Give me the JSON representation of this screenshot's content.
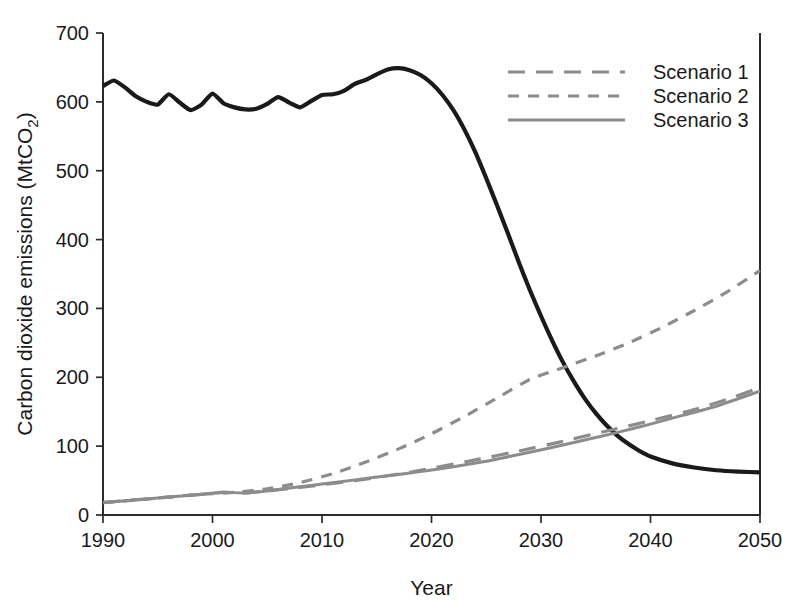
{
  "chart_data": {
    "type": "line",
    "title": "",
    "xlabel": "Year",
    "ylabel": "Carbon dioxide emissions (MtCO2)",
    "ylabel_base": "Carbon dioxide emissions (MtCO",
    "ylabel_sub": "2",
    "ylabel_close": ")",
    "xlim": [
      1990,
      2050
    ],
    "ylim": [
      0,
      700
    ],
    "xticks": [
      1990,
      2000,
      2010,
      2020,
      2030,
      2040,
      2050
    ],
    "xtick_labels": [
      "1990",
      "2000",
      "2010",
      "2020",
      "2030",
      "2040",
      "2050"
    ],
    "yticks": [
      0,
      100,
      200,
      300,
      400,
      500,
      600,
      700
    ],
    "ytick_labels": [
      "0",
      "100",
      "200",
      "300",
      "400",
      "500",
      "600",
      "700"
    ],
    "grid": false,
    "legend_position": "top-right",
    "legend": [
      "Scenario 1",
      "Scenario 2",
      "Scenario 3"
    ],
    "series": [
      {
        "name": "Historical and projected total emissions",
        "color": "#1a1a1a",
        "style": "solid",
        "width": 4.2,
        "in_legend": false,
        "x": [
          1990,
          1991,
          1992,
          1993,
          1994,
          1995,
          1996,
          1997,
          1998,
          1999,
          2000,
          2001,
          2002,
          2003,
          2004,
          2005,
          2006,
          2007,
          2008,
          2009,
          2010,
          2011,
          2012,
          2013,
          2014,
          2015,
          2016,
          2017,
          2018,
          2019,
          2020,
          2021,
          2022,
          2023,
          2024,
          2025,
          2026,
          2027,
          2028,
          2029,
          2030,
          2031,
          2032,
          2033,
          2034,
          2035,
          2036,
          2037,
          2038,
          2039,
          2040,
          2042,
          2044,
          2046,
          2048,
          2050
        ],
        "y": [
          623,
          631,
          621,
          608,
          600,
          596,
          611,
          599,
          588,
          596,
          612,
          598,
          592,
          589,
          590,
          597,
          607,
          599,
          592,
          601,
          610,
          611,
          616,
          626,
          632,
          640,
          647,
          649,
          646,
          639,
          627,
          610,
          588,
          560,
          527,
          489,
          449,
          408,
          366,
          326,
          289,
          254,
          222,
          194,
          169,
          148,
          130,
          115,
          103,
          93,
          85,
          75,
          69,
          65,
          63,
          62
        ]
      },
      {
        "name": "Scenario 1",
        "color": "#8c8c8c",
        "style": "dashed-long",
        "dasharray": "17,11",
        "width": 3.2,
        "in_legend": true,
        "x": [
          1990,
          1993,
          1996,
          1999,
          2001,
          2003,
          2005,
          2008,
          2010,
          2012,
          2014,
          2016,
          2018,
          2020,
          2024,
          2028,
          2032,
          2036,
          2040,
          2044,
          2047,
          2050
        ],
        "y": [
          18,
          22,
          26,
          30,
          33,
          32,
          35,
          40,
          44,
          48,
          52,
          57,
          62,
          68,
          80,
          93,
          107,
          122,
          137,
          153,
          168,
          185
        ]
      },
      {
        "name": "Scenario 2",
        "color": "#8c8c8c",
        "style": "dashed-medium",
        "dasharray": "11,9",
        "width": 3.2,
        "in_legend": true,
        "x": [
          1990,
          1994,
          1998,
          2002,
          2005,
          2008,
          2011,
          2014,
          2017,
          2020,
          2023,
          2026,
          2029,
          2032,
          2035,
          2038,
          2041,
          2044,
          2047,
          2050
        ],
        "y": [
          18,
          23,
          29,
          33,
          38,
          47,
          60,
          77,
          96,
          118,
          143,
          170,
          197,
          214,
          231,
          250,
          272,
          297,
          324,
          355
        ]
      },
      {
        "name": "Scenario 3",
        "color": "#8c8c8c",
        "style": "solid",
        "dasharray": "",
        "width": 3.0,
        "in_legend": true,
        "x": [
          1990,
          1993,
          1996,
          1999,
          2001,
          2003,
          2005,
          2008,
          2010,
          2013,
          2016,
          2019,
          2022,
          2025,
          2028,
          2031,
          2034,
          2037,
          2040,
          2043,
          2046,
          2050
        ],
        "y": [
          18,
          22,
          26,
          30,
          33,
          32,
          35,
          41,
          45,
          51,
          57,
          63,
          70,
          78,
          88,
          98,
          109,
          120,
          132,
          145,
          158,
          180
        ]
      }
    ],
    "axes_geometry": {
      "left_px": 103,
      "right_px": 760,
      "top_px": 33,
      "bottom_px": 515
    },
    "legend_geometry": {
      "sample_x1": 508,
      "sample_x2": 625,
      "text_x": 653,
      "rows_y": [
        72,
        96,
        120
      ]
    }
  }
}
